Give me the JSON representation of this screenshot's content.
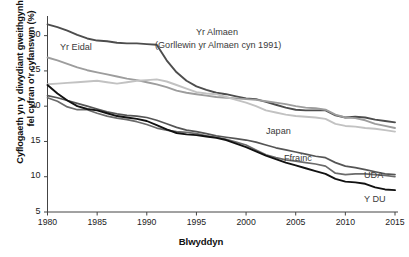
{
  "chart_data": {
    "type": "line",
    "title": "",
    "xlabel": "Blwyddyn",
    "ylabel": "Cyflogaeth yn y diwydiant gweithgynhyrchu, fel cyfran o'r cyfanswm (%)",
    "ylabel_line1": "Cyflogaeth yn y diwydiant gweithgynhyrchu,",
    "ylabel_line2": "fel cyfran o'r cyfanswm (%)",
    "xlim": [
      1980,
      2015
    ],
    "ylim": [
      5,
      32.5
    ],
    "xticks": [
      1980,
      1985,
      1990,
      1995,
      2000,
      2005,
      2010,
      2015
    ],
    "xtick_labels": [
      "1980",
      "1985",
      "1990",
      "1995",
      "2000",
      "2005",
      "2010",
      "2015"
    ],
    "yticks": [
      5,
      10,
      15,
      20,
      25,
      30
    ],
    "ytick_labels": [
      "5",
      "10",
      "15",
      "20",
      "25",
      "30"
    ],
    "grid": false,
    "legend_position": "inline-annotations",
    "x": [
      1980,
      1981,
      1982,
      1983,
      1984,
      1985,
      1986,
      1987,
      1988,
      1989,
      1990,
      1991,
      1992,
      1993,
      1994,
      1995,
      1996,
      1997,
      1998,
      1999,
      2000,
      2001,
      2002,
      2003,
      2004,
      2005,
      2006,
      2007,
      2008,
      2009,
      2010,
      2011,
      2012,
      2013,
      2014,
      2015
    ],
    "series": [
      {
        "name": "Yr Almaen",
        "label": "Yr Almaen",
        "sublabel": "(Gorllewin yr Almaen cyn 1991)",
        "color": "#4d4d4d",
        "width": 1.9,
        "values": [
          31.6,
          31.2,
          30.7,
          30.1,
          29.6,
          29.3,
          29.2,
          29.0,
          28.9,
          28.9,
          28.8,
          28.7,
          26.5,
          24.8,
          23.6,
          22.8,
          22.3,
          21.9,
          21.7,
          21.4,
          21.1,
          21.0,
          20.6,
          20.2,
          19.8,
          19.5,
          19.4,
          19.4,
          19.4,
          18.7,
          18.4,
          18.5,
          18.4,
          18.1,
          17.9,
          17.7
        ]
      },
      {
        "name": "Yr Eidal",
        "label": "Yr Eidal",
        "color": "#9d9d9d",
        "width": 1.9,
        "values": [
          26.9,
          26.5,
          26.0,
          25.5,
          25.1,
          24.8,
          24.5,
          24.2,
          23.9,
          23.7,
          23.4,
          23.1,
          22.7,
          22.2,
          21.9,
          21.7,
          21.5,
          21.3,
          21.2,
          21.1,
          21.0,
          20.9,
          20.7,
          20.5,
          20.3,
          20.0,
          19.8,
          19.7,
          19.5,
          18.8,
          18.4,
          18.3,
          18.0,
          17.5,
          17.2,
          16.9
        ]
      },
      {
        "name": "Japan",
        "label": "Japan",
        "color": "#c2c2c2",
        "width": 1.9,
        "values": [
          23.1,
          23.2,
          23.3,
          23.4,
          23.5,
          23.6,
          23.4,
          23.2,
          23.4,
          23.6,
          23.7,
          23.8,
          23.5,
          23.0,
          22.5,
          22.0,
          21.8,
          21.7,
          21.3,
          20.9,
          20.5,
          20.0,
          19.4,
          19.1,
          18.8,
          18.6,
          18.5,
          18.4,
          18.2,
          17.5,
          17.2,
          17.1,
          16.9,
          16.8,
          16.6,
          16.4
        ]
      },
      {
        "name": "Ffrainc",
        "label": "Ffrainc",
        "color": "#555555",
        "width": 1.7,
        "values": [
          21.5,
          21.2,
          20.8,
          20.4,
          20.0,
          19.6,
          19.2,
          18.9,
          18.7,
          18.6,
          18.4,
          18.0,
          17.5,
          17.0,
          16.6,
          16.4,
          16.1,
          15.8,
          15.6,
          15.4,
          15.2,
          14.9,
          14.5,
          14.1,
          13.8,
          13.5,
          13.2,
          12.9,
          12.7,
          12.0,
          11.5,
          11.3,
          11.0,
          10.7,
          10.4,
          10.3
        ]
      },
      {
        "name": "UDA",
        "label": "UDA",
        "color": "#6b6b6b",
        "width": 1.7,
        "values": [
          21.2,
          20.7,
          19.9,
          19.5,
          19.5,
          19.0,
          18.6,
          18.3,
          18.1,
          17.8,
          17.4,
          16.9,
          16.6,
          16.4,
          16.3,
          16.1,
          15.8,
          15.6,
          15.3,
          14.9,
          14.5,
          13.8,
          13.1,
          12.7,
          12.4,
          12.2,
          12.0,
          11.8,
          11.5,
          10.5,
          10.3,
          10.4,
          10.4,
          10.3,
          10.2,
          10.0
        ]
      },
      {
        "name": "Y DU",
        "label": "Y DU",
        "color": "#111111",
        "width": 1.9,
        "values": [
          23.0,
          21.8,
          20.8,
          20.0,
          19.6,
          19.4,
          19.0,
          18.6,
          18.4,
          18.2,
          17.9,
          17.3,
          16.7,
          16.2,
          16.0,
          15.9,
          15.7,
          15.5,
          15.2,
          14.7,
          14.2,
          13.6,
          13.0,
          12.5,
          12.0,
          11.6,
          11.2,
          10.8,
          10.4,
          9.7,
          9.3,
          9.2,
          9.0,
          8.5,
          8.2,
          8.1
        ]
      }
    ],
    "annotations": [
      {
        "text": "Yr Eidal",
        "x_px": 60,
        "y_px": 42
      },
      {
        "text": "Yr Almaen",
        "x_px": 196,
        "y_px": 27
      },
      {
        "text": "(Gorllewin yr Almaen cyn 1991)",
        "x_px": 155,
        "y_px": 40
      },
      {
        "text": "Japan",
        "x_px": 266,
        "y_px": 126
      },
      {
        "text": "Ffrainc",
        "x_px": 284,
        "y_px": 153
      },
      {
        "text": "UDA",
        "x_px": 364,
        "y_px": 170
      },
      {
        "text": "Y DU",
        "x_px": 364,
        "y_px": 194
      }
    ]
  }
}
